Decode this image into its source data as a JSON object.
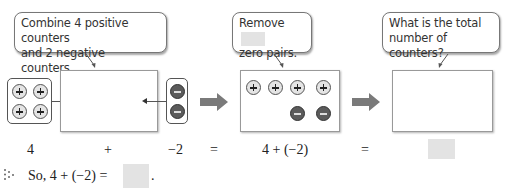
{
  "bubbles": {
    "combine": {
      "line1": "Combine 4 positive counters",
      "line2": "and 2 negative counters."
    },
    "remove": {
      "line1": "Remove",
      "line2": "zero pairs.",
      "blank": ""
    },
    "total": {
      "line1": "What is the total",
      "line2": "number of counters?"
    }
  },
  "counters": {
    "left_group": [
      "positive",
      "positive",
      "positive",
      "positive"
    ],
    "right_group": [
      "negative",
      "negative"
    ],
    "middle_box": {
      "top_row": [
        "positive",
        "positive",
        "positive",
        "positive"
      ],
      "bottom_row": [
        "negative",
        "negative"
      ]
    },
    "result_box": []
  },
  "equation": {
    "term1": "4",
    "plus": "+",
    "term2": "−2",
    "eq1": "=",
    "expr": "4 + (−2)",
    "eq2": "=",
    "answer_blank": ""
  },
  "conclusion": {
    "icon": "dots-icon",
    "text": "So, 4 + (−2) =",
    "blank": "",
    "period": "."
  },
  "colors": {
    "positive_fill": "#e4e4e4",
    "negative_fill": "#5b5b5b",
    "arrow": "#7a7a7a",
    "blank": "#e3e3e3"
  }
}
